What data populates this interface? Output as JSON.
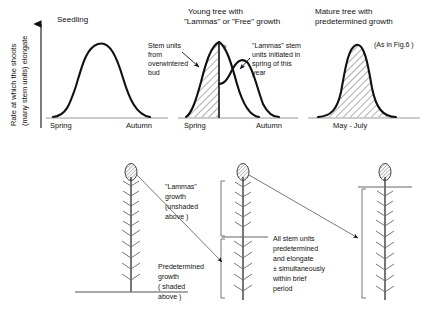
{
  "figure": {
    "type": "scientific-diagram"
  },
  "axis": {
    "y_label_line1": "Rate at which the shoots",
    "y_label_line2": "(many stem units) elongate"
  },
  "panels": [
    {
      "id": "seedling",
      "title_line1": "Seedling",
      "title_line2": "",
      "x_left_label": "Spring",
      "x_right_label": "Autumn",
      "curve_style": "unshaded",
      "annotations": []
    },
    {
      "id": "young-tree",
      "title_line1": "Young tree with",
      "title_line2": "\"Lammas\" or \"Free\" growth",
      "x_left_label": "Spring",
      "x_right_label": "Autumn",
      "curve_style": "shaded-plus-unshaded",
      "marker": "?",
      "annotations": [
        {
          "id": "stem-units-overwintered",
          "lines": [
            "Stem units",
            "from",
            "overwintered",
            "bud"
          ]
        },
        {
          "id": "lammas-stem-units",
          "lines": [
            "\"Lammas\" stem",
            "units initiated in",
            "spring of this",
            "year"
          ]
        }
      ]
    },
    {
      "id": "mature-tree",
      "title_line1": "Mature tree with",
      "title_line2": "predetermined growth",
      "x_left_label": "May - July",
      "x_right_label": "",
      "curve_style": "shaded",
      "note": "(As in Fig.6 )",
      "annotations": []
    }
  ],
  "lower": {
    "trees": [
      {
        "id": "tree-seedling",
        "bracket": "none",
        "divider": false
      },
      {
        "id": "tree-young",
        "bracket": "two-part",
        "divider": true
      },
      {
        "id": "tree-mature",
        "bracket": "full",
        "divider": true
      }
    ],
    "labels": [
      {
        "id": "lammas-growth-label",
        "lines": [
          "\"Lammas\"",
          "growth",
          "(unshaded",
          "above )"
        ]
      },
      {
        "id": "predetermined-growth-label",
        "lines": [
          "Predetermined",
          "growth",
          "( shaded",
          "above )"
        ]
      },
      {
        "id": "all-stem-units-label",
        "lines": [
          "All stem units",
          "predetermined",
          "and  elongate",
          "± simultaneously",
          "within brief",
          "period"
        ]
      }
    ]
  },
  "colors": {
    "ink": "#111111",
    "axis": "#8a8a8a",
    "hatch": "#333333",
    "background": "#ffffff"
  }
}
